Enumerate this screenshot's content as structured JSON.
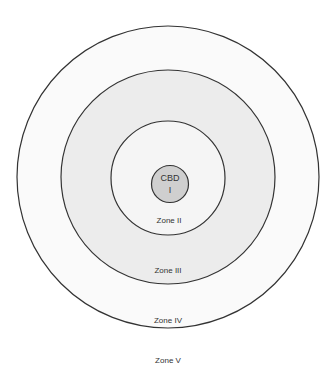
{
  "diagram": {
    "type": "concentric-zone-model",
    "colors": {
      "stroke": "#333333",
      "zone_v_bg": "#ffffff",
      "zone_iv_fill": "#fafafa",
      "zone_iii_fill": "#ececec",
      "zone_ii_fill": "#f5f5f5",
      "cbd_fill": "#cfcfcf"
    },
    "zones": [
      {
        "id": "cbd",
        "label_line1": "CBD",
        "label_line2": "I"
      },
      {
        "id": "zone-ii",
        "label": "Zone II"
      },
      {
        "id": "zone-iii",
        "label": "Zone III"
      },
      {
        "id": "zone-iv",
        "label": "Zone IV"
      },
      {
        "id": "zone-v",
        "label": "Zone V"
      }
    ]
  }
}
